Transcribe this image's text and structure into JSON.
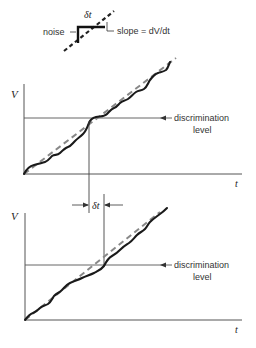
{
  "inset": {
    "noise_label": "noise",
    "delta_label": "δt",
    "slope_label": "slope = dV/dt"
  },
  "top_plot": {
    "y_axis_label": "V",
    "x_axis_label": "t",
    "level_label_line1": "discrimination",
    "level_label_line2": "level"
  },
  "interval": {
    "label": "δt"
  },
  "bottom_plot": {
    "y_axis_label": "V",
    "x_axis_label": "t",
    "level_label_line1": "discrimination",
    "level_label_line2": "level"
  },
  "colors": {
    "ink": "#222222",
    "axis": "#555555",
    "dashed": "#888888"
  }
}
